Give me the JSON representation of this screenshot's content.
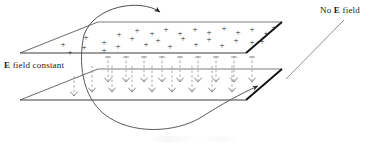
{
  "figure": {
    "background_color": "#ffffff",
    "width": 392,
    "height": 145
  },
  "labels": {
    "left": {
      "symbol": "E",
      "text": " field constant",
      "full_text": "E field constant",
      "x": 4,
      "y": 60
    },
    "right": {
      "prefix": "No ",
      "symbol": "E",
      "text": " field",
      "full_text": "No E field",
      "x": 320,
      "y": 5
    }
  },
  "plates": {
    "line_color": "#4a4a4a",
    "edge_color": "#111111",
    "top": {
      "name": "positively-charged-plate",
      "charge_sign": "+",
      "points": "20,53 98,22 282,22 246,53",
      "charge_count": 30
    },
    "bottom": {
      "name": "negatively-charged-plate",
      "charge_sign": "-",
      "points": "20,100 98,69 282,69 246,100"
    }
  },
  "charges": {
    "symbol": "+",
    "color": "#2b2b2b",
    "positions": [
      [
        63,
        44
      ],
      [
        84,
        47
      ],
      [
        104,
        42
      ],
      [
        118,
        46
      ],
      [
        132,
        38
      ],
      [
        146,
        44
      ],
      [
        158,
        40
      ],
      [
        170,
        46
      ],
      [
        183,
        38
      ],
      [
        196,
        44
      ],
      [
        209,
        39
      ],
      [
        222,
        45
      ],
      [
        236,
        40
      ],
      [
        137,
        30
      ],
      [
        152,
        33
      ],
      [
        166,
        29
      ],
      [
        180,
        33
      ],
      [
        195,
        29
      ],
      [
        209,
        32
      ],
      [
        224,
        28
      ],
      [
        238,
        32
      ],
      [
        252,
        29
      ],
      [
        266,
        33
      ],
      [
        252,
        42
      ],
      [
        119,
        34
      ],
      [
        104,
        50
      ],
      [
        86,
        37
      ],
      [
        70,
        52
      ],
      [
        262,
        41
      ],
      [
        274,
        27
      ]
    ]
  },
  "field_lines": {
    "name": "electric-field-lines",
    "style": "dashed",
    "direction": "downward",
    "color": "#7a7a7a",
    "count": 18,
    "arrowhead": "down-left-tick"
  },
  "trajectory": {
    "name": "particle-trajectory",
    "color": "#555555",
    "segments": [
      {
        "name": "entry-arc-top",
        "description": "arc entering over top plate with arrowhead pointing right-down"
      },
      {
        "name": "deflection-arc",
        "description": "large arc curving down through the plates"
      },
      {
        "name": "exit-arc",
        "description": "arc exiting to lower right with arrowhead pointing up-right into field-free region"
      },
      {
        "name": "field-free-line",
        "description": "straight line rising toward the No E field label"
      }
    ]
  }
}
